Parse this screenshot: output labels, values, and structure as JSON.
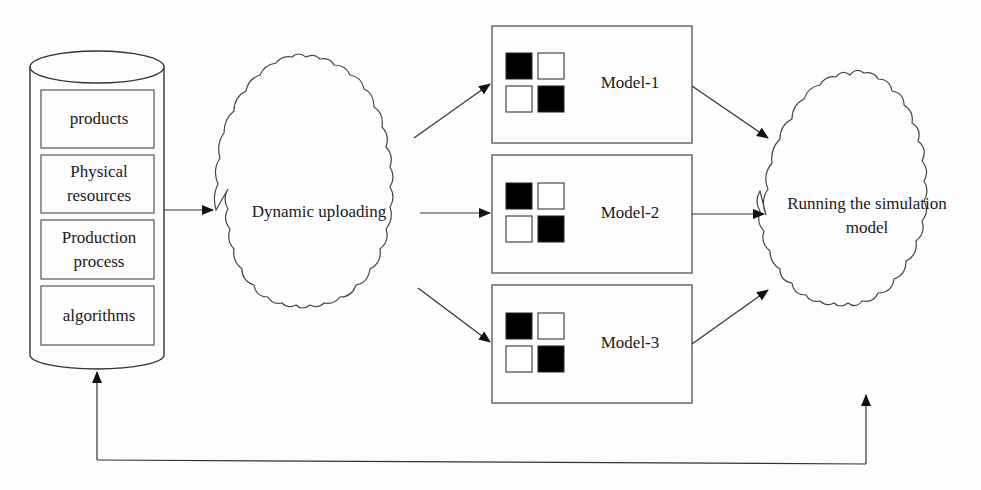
{
  "diagram": {
    "database": {
      "items": [
        {
          "label": "products"
        },
        {
          "label": "Physical resources",
          "lines": [
            "Physical",
            "resources"
          ]
        },
        {
          "label": "Production process",
          "lines": [
            "Production",
            "process"
          ]
        },
        {
          "label": "algorithms"
        }
      ]
    },
    "upload_cloud": {
      "label": "Dynamic uploading"
    },
    "models": [
      {
        "label": "Model-1"
      },
      {
        "label": "Model-2"
      },
      {
        "label": "Model-3"
      }
    ],
    "run_cloud": {
      "lines": [
        "Running the simulation",
        "model"
      ]
    },
    "colors": {
      "stroke": "#333333",
      "fill_dark": "#000000",
      "background": "#fdfdfd"
    }
  }
}
